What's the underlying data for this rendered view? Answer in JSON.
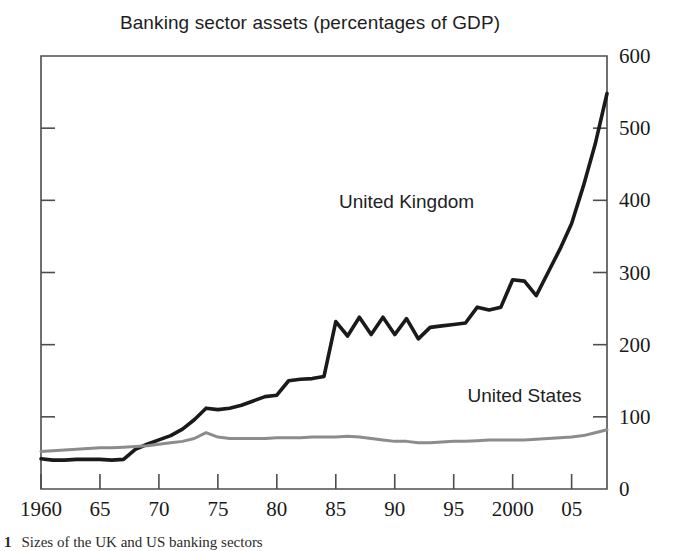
{
  "figure": {
    "title": "Banking sector assets (percentages of GDP)",
    "caption_number": "1",
    "caption_text": "Sizes of the UK and US banking sectors"
  },
  "axes": {
    "y_tick_labels": [
      "600",
      "500",
      "400",
      "300",
      "200",
      "100",
      "0"
    ],
    "x_tick_labels": [
      "1960",
      "65",
      "70",
      "75",
      "80",
      "85",
      "90",
      "95",
      "2000",
      "05"
    ],
    "y_axis_side": "right",
    "x_axis_side": "bottom"
  },
  "series_labels": {
    "uk": "United Kingdom",
    "us": "United States"
  },
  "colors": {
    "uk_line": "#1a1a1a",
    "us_line": "#8c8c8c",
    "axis": "#4d4d4d",
    "background": "#ffffff",
    "text": "#1a1a1a"
  },
  "chart_data": {
    "type": "line",
    "title": "Banking sector assets (percentages of GDP)",
    "xlabel": "",
    "ylabel": "",
    "xlim": [
      1960,
      2008
    ],
    "ylim": [
      0,
      600
    ],
    "yticks": [
      0,
      100,
      200,
      300,
      400,
      500,
      600
    ],
    "xticks": [
      1960,
      1965,
      1970,
      1975,
      1980,
      1985,
      1990,
      1995,
      2000,
      2005
    ],
    "grid": false,
    "legend": "inline-labels",
    "x": [
      1960,
      1961,
      1962,
      1963,
      1964,
      1965,
      1966,
      1967,
      1968,
      1969,
      1970,
      1971,
      1972,
      1973,
      1974,
      1975,
      1976,
      1977,
      1978,
      1979,
      1980,
      1981,
      1982,
      1983,
      1984,
      1985,
      1986,
      1987,
      1988,
      1989,
      1990,
      1991,
      1992,
      1993,
      1994,
      1995,
      1996,
      1997,
      1998,
      1999,
      2000,
      2001,
      2002,
      2003,
      2004,
      2005,
      2006,
      2007,
      2008
    ],
    "series": [
      {
        "name": "United Kingdom",
        "color": "#1a1a1a",
        "values": [
          42,
          40,
          40,
          41,
          41,
          41,
          40,
          41,
          55,
          62,
          68,
          74,
          83,
          96,
          112,
          110,
          112,
          116,
          122,
          128,
          130,
          150,
          152,
          153,
          156,
          232,
          212,
          238,
          214,
          238,
          214,
          236,
          208,
          224,
          226,
          228,
          230,
          252,
          248,
          252,
          290,
          288,
          268,
          300,
          332,
          368,
          420,
          478,
          548
        ]
      },
      {
        "name": "United States",
        "color": "#8c8c8c",
        "values": [
          52,
          53,
          54,
          55,
          56,
          57,
          57,
          58,
          59,
          60,
          62,
          64,
          66,
          70,
          78,
          72,
          70,
          70,
          70,
          70,
          71,
          71,
          71,
          72,
          72,
          72,
          73,
          72,
          70,
          68,
          66,
          66,
          64,
          64,
          65,
          66,
          66,
          67,
          68,
          68,
          68,
          68,
          69,
          70,
          71,
          72,
          74,
          78,
          82
        ]
      }
    ],
    "annotations": [
      {
        "text": "United Kingdom",
        "x": 1991,
        "y": 390
      },
      {
        "text": "United States",
        "x": 2001,
        "y": 120
      }
    ]
  }
}
